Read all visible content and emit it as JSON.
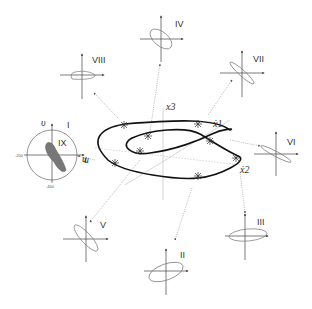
{
  "diagram": {
    "type": "phase-portrait-with-lissajous-insets",
    "central_curve": {
      "axes": {
        "x1": "ẋ1",
        "x2": "ẋ2",
        "x3": "x3",
        "u": "u"
      },
      "colors": {
        "curve": "#111111",
        "axes": "#aaaaaa",
        "leaders": "#888888"
      }
    },
    "insets": [
      {
        "id": "I",
        "label": "I",
        "sublabel": "IX",
        "kind": "circle",
        "axis_x": "u",
        "axis_y": "υ",
        "tick_left": "-200",
        "tick_bottom": "-400"
      },
      {
        "id": "II",
        "label": "II"
      },
      {
        "id": "III",
        "label": "III"
      },
      {
        "id": "IV",
        "label": "IV"
      },
      {
        "id": "V",
        "label": "V"
      },
      {
        "id": "VI",
        "label": "VI"
      },
      {
        "id": "VII",
        "label": "VII"
      },
      {
        "id": "VIII",
        "label": "VIII"
      }
    ]
  }
}
